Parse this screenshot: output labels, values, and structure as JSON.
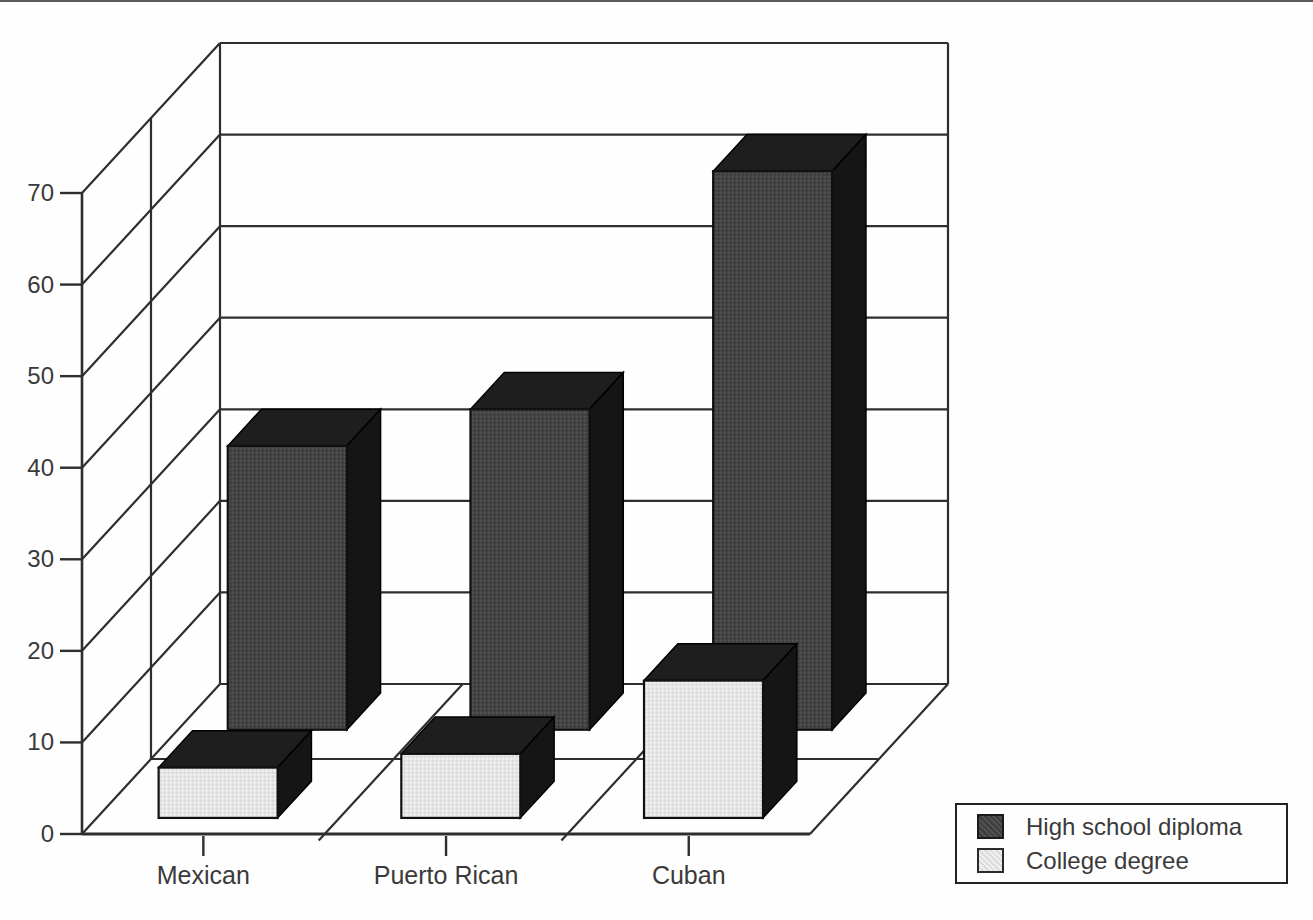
{
  "chart_data": {
    "type": "bar",
    "projection": "3d-oblique",
    "categories": [
      "Mexican",
      "Puerto Rican",
      "Cuban"
    ],
    "series": [
      {
        "name": "High school diploma",
        "values": [
          31,
          35,
          61
        ],
        "color": "#454545"
      },
      {
        "name": "College degree",
        "values": [
          5.5,
          7,
          15
        ],
        "color": "#e6e6e6"
      }
    ],
    "ylim": [
      0,
      70
    ],
    "ytick_step": 10,
    "ytick_labels": [
      "0",
      "10",
      "20",
      "30",
      "40",
      "50",
      "60",
      "70"
    ],
    "grid": "on",
    "legend": {
      "position": "bottom-right",
      "items": [
        "High school diploma",
        "College degree"
      ]
    },
    "colors": {
      "bar_top": "#1e1e1e",
      "bar_side": "#151515",
      "line": "#2e2e2e",
      "text": "#3a3a3a",
      "background": "#fefefe"
    }
  }
}
